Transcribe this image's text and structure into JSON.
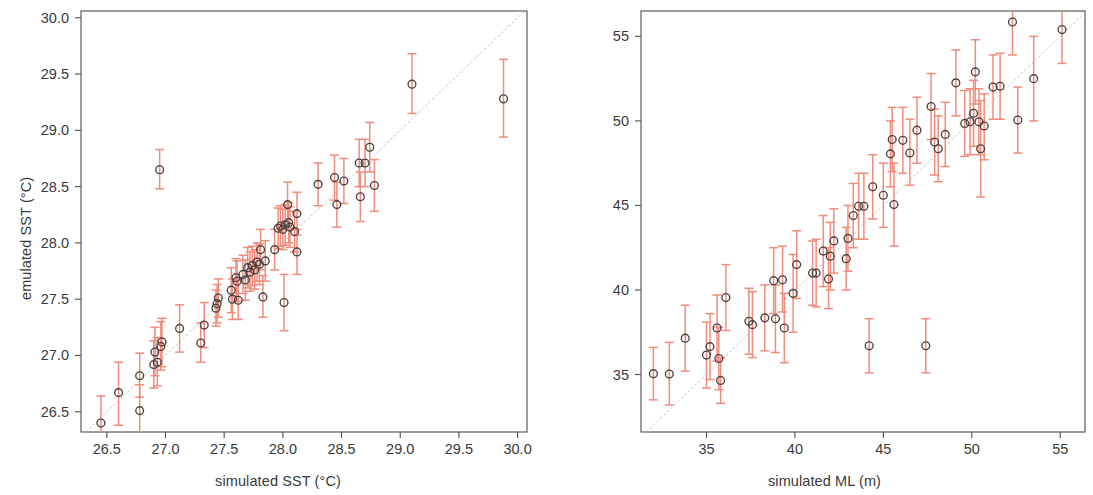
{
  "figure": {
    "background": "#ffffff",
    "marker_color": "#4a4140",
    "errorbar_color": "#f08c7c",
    "identity_line_color": "#b9b9b9",
    "axis_color": "#555555"
  },
  "panels": [
    {
      "id": "sst",
      "xlabel": "simulated SST (°C)",
      "ylabel": "emulated SST (°C)"
    },
    {
      "id": "ml",
      "xlabel": "simulated ML (m)",
      "ylabel": "emulated ML (m)"
    }
  ],
  "chart_data": [
    {
      "type": "scatter",
      "id": "sst",
      "title": "",
      "xlabel": "simulated SST (°C)",
      "ylabel": "emulated SST (°C)",
      "xlim": [
        26.28,
        30.08
      ],
      "ylim": [
        26.32,
        30.06
      ],
      "xticks": [
        26.5,
        27.0,
        27.5,
        28.0,
        28.5,
        29.0,
        29.5,
        30.0
      ],
      "xticklabels": [
        "26.5",
        "27.0",
        "27.5",
        "28.0",
        "28.5",
        "29.0",
        "29.5",
        "30.0"
      ],
      "yticks": [
        26.5,
        27.0,
        27.5,
        28.0,
        28.5,
        29.0,
        29.5,
        30.0
      ],
      "yticklabels": [
        "26.5",
        "27.0",
        "27.5",
        "28.0",
        "28.5",
        "29.0",
        "29.5",
        "30.0"
      ],
      "grid": false,
      "legend": null,
      "has_identity_line": true,
      "identity_line_style": "dashed",
      "errorbar_orientation": "vertical",
      "points": [
        {
          "x": 26.45,
          "y": 26.4,
          "ylo": 26.18,
          "yhi": 26.64
        },
        {
          "x": 26.6,
          "y": 26.67,
          "ylo": 26.38,
          "yhi": 26.94
        },
        {
          "x": 26.78,
          "y": 26.82,
          "ylo": 26.63,
          "yhi": 27.02
        },
        {
          "x": 26.78,
          "y": 26.51,
          "ylo": 26.29,
          "yhi": 26.74
        },
        {
          "x": 26.9,
          "y": 26.92,
          "ylo": 26.71,
          "yhi": 27.13
        },
        {
          "x": 26.91,
          "y": 27.03,
          "ylo": 26.82,
          "yhi": 27.25
        },
        {
          "x": 26.93,
          "y": 26.94,
          "ylo": 26.73,
          "yhi": 27.16
        },
        {
          "x": 26.96,
          "y": 27.08,
          "ylo": 26.87,
          "yhi": 27.3
        },
        {
          "x": 26.97,
          "y": 27.12,
          "ylo": 26.9,
          "yhi": 27.33
        },
        {
          "x": 26.95,
          "y": 28.65,
          "ylo": 28.48,
          "yhi": 28.83
        },
        {
          "x": 27.12,
          "y": 27.24,
          "ylo": 27.03,
          "yhi": 27.45
        },
        {
          "x": 27.3,
          "y": 27.11,
          "ylo": 26.94,
          "yhi": 27.29
        },
        {
          "x": 27.33,
          "y": 27.27,
          "ylo": 27.07,
          "yhi": 27.47
        },
        {
          "x": 27.43,
          "y": 27.42,
          "ylo": 27.26,
          "yhi": 27.58
        },
        {
          "x": 27.44,
          "y": 27.46,
          "ylo": 27.29,
          "yhi": 27.63
        },
        {
          "x": 27.45,
          "y": 27.51,
          "ylo": 27.34,
          "yhi": 27.68
        },
        {
          "x": 27.56,
          "y": 27.58,
          "ylo": 27.38,
          "yhi": 27.78
        },
        {
          "x": 27.57,
          "y": 27.5,
          "ylo": 27.32,
          "yhi": 27.68
        },
        {
          "x": 27.6,
          "y": 27.69,
          "ylo": 27.52,
          "yhi": 27.86
        },
        {
          "x": 27.61,
          "y": 27.66,
          "ylo": 27.48,
          "yhi": 27.84
        },
        {
          "x": 27.62,
          "y": 27.49,
          "ylo": 27.32,
          "yhi": 27.67
        },
        {
          "x": 27.66,
          "y": 27.72,
          "ylo": 27.55,
          "yhi": 27.89
        },
        {
          "x": 27.68,
          "y": 27.67,
          "ylo": 27.49,
          "yhi": 27.85
        },
        {
          "x": 27.7,
          "y": 27.78,
          "ylo": 27.6,
          "yhi": 27.96
        },
        {
          "x": 27.72,
          "y": 27.74,
          "ylo": 27.57,
          "yhi": 27.92
        },
        {
          "x": 27.74,
          "y": 27.8,
          "ylo": 27.62,
          "yhi": 27.97
        },
        {
          "x": 27.76,
          "y": 27.76,
          "ylo": 27.59,
          "yhi": 27.94
        },
        {
          "x": 27.78,
          "y": 27.83,
          "ylo": 27.66,
          "yhi": 28.0
        },
        {
          "x": 27.8,
          "y": 27.81,
          "ylo": 27.63,
          "yhi": 27.99
        },
        {
          "x": 27.81,
          "y": 27.94,
          "ylo": 27.76,
          "yhi": 28.12
        },
        {
          "x": 27.83,
          "y": 27.52,
          "ylo": 27.34,
          "yhi": 27.71
        },
        {
          "x": 27.85,
          "y": 27.84,
          "ylo": 27.66,
          "yhi": 28.02
        },
        {
          "x": 27.93,
          "y": 27.94,
          "ylo": 27.76,
          "yhi": 28.12
        },
        {
          "x": 27.96,
          "y": 28.13,
          "ylo": 27.95,
          "yhi": 28.31
        },
        {
          "x": 27.98,
          "y": 28.15,
          "ylo": 27.97,
          "yhi": 28.33
        },
        {
          "x": 28.0,
          "y": 28.12,
          "ylo": 27.94,
          "yhi": 28.3
        },
        {
          "x": 28.02,
          "y": 28.16,
          "ylo": 27.98,
          "yhi": 28.34
        },
        {
          "x": 28.01,
          "y": 27.47,
          "ylo": 27.22,
          "yhi": 27.72
        },
        {
          "x": 28.04,
          "y": 28.34,
          "ylo": 28.14,
          "yhi": 28.54
        },
        {
          "x": 28.05,
          "y": 28.18,
          "ylo": 28.0,
          "yhi": 28.36
        },
        {
          "x": 28.06,
          "y": 28.14,
          "ylo": 27.96,
          "yhi": 28.32
        },
        {
          "x": 28.1,
          "y": 28.1,
          "ylo": 27.92,
          "yhi": 28.28
        },
        {
          "x": 28.12,
          "y": 28.26,
          "ylo": 28.07,
          "yhi": 28.45
        },
        {
          "x": 28.12,
          "y": 27.92,
          "ylo": 27.72,
          "yhi": 28.12
        },
        {
          "x": 28.3,
          "y": 28.52,
          "ylo": 28.33,
          "yhi": 28.71
        },
        {
          "x": 28.44,
          "y": 28.58,
          "ylo": 28.38,
          "yhi": 28.78
        },
        {
          "x": 28.46,
          "y": 28.34,
          "ylo": 28.14,
          "yhi": 28.54
        },
        {
          "x": 28.52,
          "y": 28.55,
          "ylo": 28.35,
          "yhi": 28.75
        },
        {
          "x": 28.65,
          "y": 28.71,
          "ylo": 28.5,
          "yhi": 28.92
        },
        {
          "x": 28.66,
          "y": 28.41,
          "ylo": 28.19,
          "yhi": 28.63
        },
        {
          "x": 28.7,
          "y": 28.71,
          "ylo": 28.5,
          "yhi": 28.92
        },
        {
          "x": 28.74,
          "y": 28.85,
          "ylo": 28.63,
          "yhi": 29.07
        },
        {
          "x": 28.78,
          "y": 28.51,
          "ylo": 28.28,
          "yhi": 28.74
        },
        {
          "x": 29.1,
          "y": 29.41,
          "ylo": 29.15,
          "yhi": 29.68
        },
        {
          "x": 29.88,
          "y": 29.28,
          "ylo": 28.94,
          "yhi": 29.63
        }
      ]
    },
    {
      "type": "scatter",
      "id": "ml",
      "title": "",
      "xlabel": "simulated ML (m)",
      "ylabel": "emulated ML (m)",
      "xlim": [
        31.3,
        56.4
      ],
      "ylim": [
        31.6,
        56.5
      ],
      "xticks": [
        35,
        40,
        45,
        50,
        55
      ],
      "xticklabels": [
        "35",
        "40",
        "45",
        "50",
        "55"
      ],
      "yticks": [
        35,
        40,
        45,
        50,
        55
      ],
      "yticklabels": [
        "35",
        "40",
        "45",
        "50",
        "55"
      ],
      "grid": false,
      "legend": null,
      "has_identity_line": true,
      "identity_line_style": "dashed",
      "errorbar_orientation": "vertical",
      "points": [
        {
          "x": 32.0,
          "y": 35.05,
          "ylo": 33.5,
          "yhi": 36.6
        },
        {
          "x": 32.9,
          "y": 35.03,
          "ylo": 33.2,
          "yhi": 36.9
        },
        {
          "x": 33.8,
          "y": 37.15,
          "ylo": 35.2,
          "yhi": 39.1
        },
        {
          "x": 35.0,
          "y": 36.15,
          "ylo": 34.2,
          "yhi": 38.1
        },
        {
          "x": 35.2,
          "y": 36.65,
          "ylo": 34.7,
          "yhi": 38.6
        },
        {
          "x": 35.6,
          "y": 37.75,
          "ylo": 35.8,
          "yhi": 39.7
        },
        {
          "x": 35.7,
          "y": 35.95,
          "ylo": 34.1,
          "yhi": 37.8
        },
        {
          "x": 35.8,
          "y": 34.65,
          "ylo": 33.3,
          "yhi": 36.0
        },
        {
          "x": 36.1,
          "y": 39.55,
          "ylo": 37.6,
          "yhi": 41.5
        },
        {
          "x": 37.4,
          "y": 38.15,
          "ylo": 36.2,
          "yhi": 40.1
        },
        {
          "x": 37.6,
          "y": 37.95,
          "ylo": 36.0,
          "yhi": 39.9
        },
        {
          "x": 38.3,
          "y": 38.35,
          "ylo": 36.4,
          "yhi": 40.3
        },
        {
          "x": 38.8,
          "y": 40.55,
          "ylo": 38.6,
          "yhi": 42.5
        },
        {
          "x": 38.9,
          "y": 38.3,
          "ylo": 36.3,
          "yhi": 40.3
        },
        {
          "x": 39.3,
          "y": 40.6,
          "ylo": 38.7,
          "yhi": 42.6
        },
        {
          "x": 39.4,
          "y": 37.75,
          "ylo": 35.7,
          "yhi": 39.8
        },
        {
          "x": 39.9,
          "y": 39.8,
          "ylo": 37.5,
          "yhi": 42.1
        },
        {
          "x": 40.1,
          "y": 41.5,
          "ylo": 39.5,
          "yhi": 43.5
        },
        {
          "x": 41.0,
          "y": 41.0,
          "ylo": 39.1,
          "yhi": 42.9
        },
        {
          "x": 41.6,
          "y": 42.3,
          "ylo": 40.2,
          "yhi": 44.4
        },
        {
          "x": 41.9,
          "y": 40.65,
          "ylo": 38.9,
          "yhi": 42.5
        },
        {
          "x": 41.2,
          "y": 41.0,
          "ylo": 39.0,
          "yhi": 43.0
        },
        {
          "x": 42.0,
          "y": 42.0,
          "ylo": 40.0,
          "yhi": 44.0
        },
        {
          "x": 42.2,
          "y": 42.9,
          "ylo": 41.0,
          "yhi": 44.8
        },
        {
          "x": 42.9,
          "y": 41.85,
          "ylo": 40.0,
          "yhi": 43.7
        },
        {
          "x": 43.0,
          "y": 43.05,
          "ylo": 41.1,
          "yhi": 45.0
        },
        {
          "x": 43.3,
          "y": 44.4,
          "ylo": 42.5,
          "yhi": 46.3
        },
        {
          "x": 43.6,
          "y": 44.95,
          "ylo": 43.0,
          "yhi": 46.9
        },
        {
          "x": 43.9,
          "y": 44.95,
          "ylo": 43.0,
          "yhi": 46.9
        },
        {
          "x": 44.2,
          "y": 36.7,
          "ylo": 35.1,
          "yhi": 38.3
        },
        {
          "x": 44.4,
          "y": 46.1,
          "ylo": 44.2,
          "yhi": 48.0
        },
        {
          "x": 45.0,
          "y": 45.6,
          "ylo": 43.7,
          "yhi": 47.5
        },
        {
          "x": 45.4,
          "y": 48.05,
          "ylo": 46.1,
          "yhi": 50.0
        },
        {
          "x": 45.5,
          "y": 48.9,
          "ylo": 47.0,
          "yhi": 50.8
        },
        {
          "x": 45.6,
          "y": 45.05,
          "ylo": 42.6,
          "yhi": 47.5
        },
        {
          "x": 46.1,
          "y": 48.85,
          "ylo": 46.9,
          "yhi": 50.8
        },
        {
          "x": 46.5,
          "y": 48.1,
          "ylo": 46.2,
          "yhi": 50.1
        },
        {
          "x": 46.9,
          "y": 49.45,
          "ylo": 47.5,
          "yhi": 51.4
        },
        {
          "x": 47.4,
          "y": 36.7,
          "ylo": 35.1,
          "yhi": 38.3
        },
        {
          "x": 47.7,
          "y": 50.85,
          "ylo": 48.9,
          "yhi": 52.8
        },
        {
          "x": 47.9,
          "y": 48.75,
          "ylo": 46.8,
          "yhi": 50.7
        },
        {
          "x": 48.1,
          "y": 48.35,
          "ylo": 46.4,
          "yhi": 50.3
        },
        {
          "x": 48.5,
          "y": 49.2,
          "ylo": 47.3,
          "yhi": 51.1
        },
        {
          "x": 49.1,
          "y": 52.25,
          "ylo": 50.3,
          "yhi": 54.2
        },
        {
          "x": 49.6,
          "y": 49.85,
          "ylo": 47.9,
          "yhi": 51.8
        },
        {
          "x": 49.9,
          "y": 49.95,
          "ylo": 48.0,
          "yhi": 51.9
        },
        {
          "x": 50.1,
          "y": 50.45,
          "ylo": 48.5,
          "yhi": 52.4
        },
        {
          "x": 50.2,
          "y": 52.9,
          "ylo": 51.0,
          "yhi": 54.8
        },
        {
          "x": 50.4,
          "y": 49.95,
          "ylo": 48.0,
          "yhi": 51.9
        },
        {
          "x": 50.5,
          "y": 48.35,
          "ylo": 45.5,
          "yhi": 51.2
        },
        {
          "x": 50.7,
          "y": 49.7,
          "ylo": 47.7,
          "yhi": 51.6
        },
        {
          "x": 51.2,
          "y": 52.0,
          "ylo": 50.1,
          "yhi": 53.9
        },
        {
          "x": 51.6,
          "y": 52.05,
          "ylo": 50.1,
          "yhi": 54.0
        },
        {
          "x": 52.3,
          "y": 55.85,
          "ylo": 53.9,
          "yhi": 57.8
        },
        {
          "x": 52.6,
          "y": 50.05,
          "ylo": 48.1,
          "yhi": 52.0
        },
        {
          "x": 53.5,
          "y": 52.5,
          "ylo": 50.0,
          "yhi": 55.0
        },
        {
          "x": 55.1,
          "y": 55.4,
          "ylo": 53.4,
          "yhi": 57.3
        }
      ]
    }
  ]
}
